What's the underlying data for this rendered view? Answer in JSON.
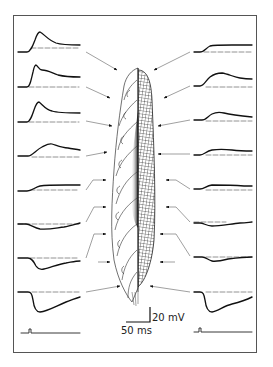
{
  "figure": {
    "scale_bar": {
      "voltage_label": "20 mV",
      "time_label": "50 ms"
    },
    "colors": {
      "trace": "#1a1a1a",
      "baseline": "#555555",
      "arrow": "#666666",
      "frame": "#555555",
      "drawing": "#222222"
    },
    "left_traces": [
      {
        "row": 1,
        "y": 52,
        "type": "depolarizing",
        "amplitude": 19,
        "shape": "fast-peak"
      },
      {
        "row": 2,
        "y": 87,
        "type": "depolarizing",
        "amplitude": 19,
        "shape": "peak-shoulder"
      },
      {
        "row": 3,
        "y": 122,
        "type": "depolarizing",
        "amplitude": 18,
        "shape": "fast-peak"
      },
      {
        "row": 4,
        "y": 157,
        "type": "depolarizing",
        "amplitude": 10,
        "shape": "slow-peak"
      },
      {
        "row": 5,
        "y": 190,
        "type": "depolarizing",
        "amplitude": 5,
        "shape": "plateau"
      },
      {
        "row": 6,
        "y": 225,
        "type": "hyperpolarizing",
        "amplitude": -4,
        "shape": "slow"
      },
      {
        "row": 7,
        "y": 258,
        "type": "hyperpolarizing",
        "amplitude": -11,
        "shape": "trough"
      },
      {
        "row": 8,
        "y": 292,
        "type": "hyperpolarizing",
        "amplitude": -20,
        "shape": "deep-trough"
      }
    ],
    "right_traces": [
      {
        "row": 1,
        "y": 52,
        "type": "depolarizing",
        "amplitude": 7,
        "shape": "plateau"
      },
      {
        "row": 2,
        "y": 87,
        "type": "depolarizing",
        "amplitude": 13,
        "shape": "slow-peak"
      },
      {
        "row": 3,
        "y": 121,
        "type": "depolarizing",
        "amplitude": 8,
        "shape": "slow-peak"
      },
      {
        "row": 4,
        "y": 155,
        "type": "depolarizing",
        "amplitude": 6,
        "shape": "slow-peak"
      },
      {
        "row": 5,
        "y": 190,
        "type": "depolarizing",
        "amplitude": 4,
        "shape": "plateau"
      },
      {
        "row": 6,
        "y": 223,
        "type": "hyperpolarizing",
        "amplitude": -4,
        "shape": "slow"
      },
      {
        "row": 7,
        "y": 257,
        "type": "hyperpolarizing",
        "amplitude": -8,
        "shape": "trough"
      },
      {
        "row": 8,
        "y": 292,
        "type": "hyperpolarizing",
        "amplitude": -21,
        "shape": "deep-trough"
      }
    ],
    "stimulus": {
      "left_y": 333,
      "right_y": 333
    }
  }
}
